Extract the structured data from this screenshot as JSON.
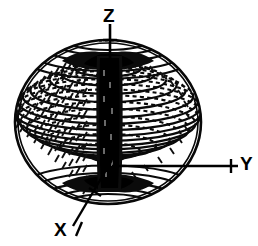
{
  "figure": {
    "style": "scanned line-art halftone",
    "background_color": "#ffffff",
    "ink_color": "#000000"
  },
  "axes": [
    {
      "name": "z-axis",
      "label": "Z",
      "direction": "up",
      "has_tick": true,
      "label_x": 103,
      "label_y": 6
    },
    {
      "name": "y-axis",
      "label": "Y",
      "direction": "right",
      "has_tick": true,
      "label_x": 240,
      "label_y": 154
    },
    {
      "name": "x-axis",
      "label": "X",
      "direction": "down-left",
      "has_tick": true,
      "label_x": 54,
      "label_y": 220
    }
  ],
  "geometry": {
    "sphere": {
      "center_x": 108,
      "center_y": 122,
      "radius_x": 93,
      "radius_y": 82,
      "latitude_ring_count": 30,
      "front_arc_style": "solid",
      "back_arc_style": "dashed",
      "hatch_marks": true
    },
    "spindle": {
      "name": "polar-spindle",
      "center_x": 110,
      "top_y": 52,
      "bottom_y": 192,
      "half_width": 11,
      "fill": "#000000",
      "description": "dark vertical cylinder along the polar axis"
    },
    "funnels": [
      {
        "name": "north-pole-funnel",
        "pole": "north",
        "center_y": 56
      },
      {
        "name": "south-pole-funnel",
        "pole": "south",
        "center_y": 188
      }
    ],
    "z_axis_line": {
      "x": 110,
      "y_top": 24,
      "y_bottom": 58,
      "tick_y": 40,
      "tick_half_width": 7
    },
    "y_axis_line": {
      "y": 166,
      "x_start": 110,
      "x_end": 238,
      "tick_x": 231,
      "tick_half_height": 7
    },
    "x_axis_line": {
      "x_start": 112,
      "y_start": 160,
      "x_end": 73,
      "y_end": 226,
      "tick_x": 95,
      "tick_y": 193
    }
  }
}
